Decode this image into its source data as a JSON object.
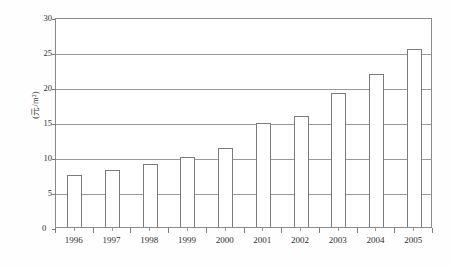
{
  "chart_data": {
    "type": "bar",
    "title": "",
    "subtitle": "",
    "xlabel": "",
    "ylabel": "(元/m²)",
    "categories": [
      "1996",
      "1997",
      "1998",
      "1999",
      "2000",
      "2001",
      "2002",
      "2003",
      "2004",
      "2005"
    ],
    "values": [
      7.5,
      8.2,
      9.0,
      10.0,
      11.3,
      14.8,
      15.8,
      19.2,
      21.8,
      25.5
    ],
    "series": [
      {
        "name": "",
        "values": [
          7.5,
          8.2,
          9.0,
          10.0,
          11.3,
          14.8,
          15.8,
          19.2,
          21.8,
          25.5
        ]
      }
    ],
    "ylim": [
      0,
      30
    ],
    "ytick_values": [
      0,
      5,
      10,
      15,
      20,
      25,
      30
    ],
    "ytick_labels": [
      "0",
      "5",
      "10",
      "15",
      "20",
      "25",
      "30"
    ],
    "grid": true,
    "grid_axis": "y",
    "legend": false,
    "legend_position": "none",
    "bar_fill_color": "#ffffff",
    "bar_edge_color": "#7b7b7b",
    "gridline_color": "#9a9a9a",
    "axis_color": "#8a8a8a",
    "background_color": "#ffffff"
  },
  "axis": {
    "origin_label": "0",
    "y_unit_label": "(元/m²)"
  }
}
